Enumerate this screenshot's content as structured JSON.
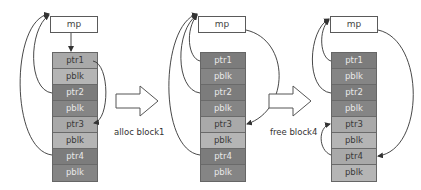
{
  "diagram": {
    "panels": [
      {
        "id": "initial",
        "mp_label": "mp",
        "cells": [
          {
            "label": "ptr1",
            "state": "free-ptr"
          },
          {
            "label": "pblk",
            "state": "free-blk"
          },
          {
            "label": "ptr2",
            "state": "used-ptr"
          },
          {
            "label": "pblk",
            "state": "used-blk"
          },
          {
            "label": "ptr3",
            "state": "free-ptr"
          },
          {
            "label": "pblk",
            "state": "free-blk"
          },
          {
            "label": "ptr4",
            "state": "used-ptr"
          },
          {
            "label": "pblk",
            "state": "used-blk"
          }
        ]
      },
      {
        "id": "after-alloc",
        "mp_label": "mp",
        "cells": [
          {
            "label": "ptr1",
            "state": "used-ptr"
          },
          {
            "label": "pblk",
            "state": "used-blk"
          },
          {
            "label": "ptr2",
            "state": "used-ptr"
          },
          {
            "label": "pblk",
            "state": "used-blk"
          },
          {
            "label": "ptr3",
            "state": "free-ptr"
          },
          {
            "label": "pblk",
            "state": "free-blk"
          },
          {
            "label": "ptr4",
            "state": "used-ptr"
          },
          {
            "label": "pblk",
            "state": "used-blk"
          }
        ]
      },
      {
        "id": "after-free",
        "mp_label": "mp",
        "cells": [
          {
            "label": "ptr1",
            "state": "used-ptr"
          },
          {
            "label": "pblk",
            "state": "used-blk"
          },
          {
            "label": "ptr2",
            "state": "used-ptr"
          },
          {
            "label": "pblk",
            "state": "used-blk"
          },
          {
            "label": "ptr3",
            "state": "free-ptr"
          },
          {
            "label": "pblk",
            "state": "free-blk"
          },
          {
            "label": "ptr4",
            "state": "free-ptr"
          },
          {
            "label": "pblk",
            "state": "free-blk"
          }
        ]
      }
    ],
    "transitions": [
      {
        "label": "alloc block1"
      },
      {
        "label": "free block4"
      }
    ],
    "colors": {
      "free_cell": "#a9a9a9",
      "used_cell": "#7c7c7c",
      "line": "#333333"
    }
  }
}
